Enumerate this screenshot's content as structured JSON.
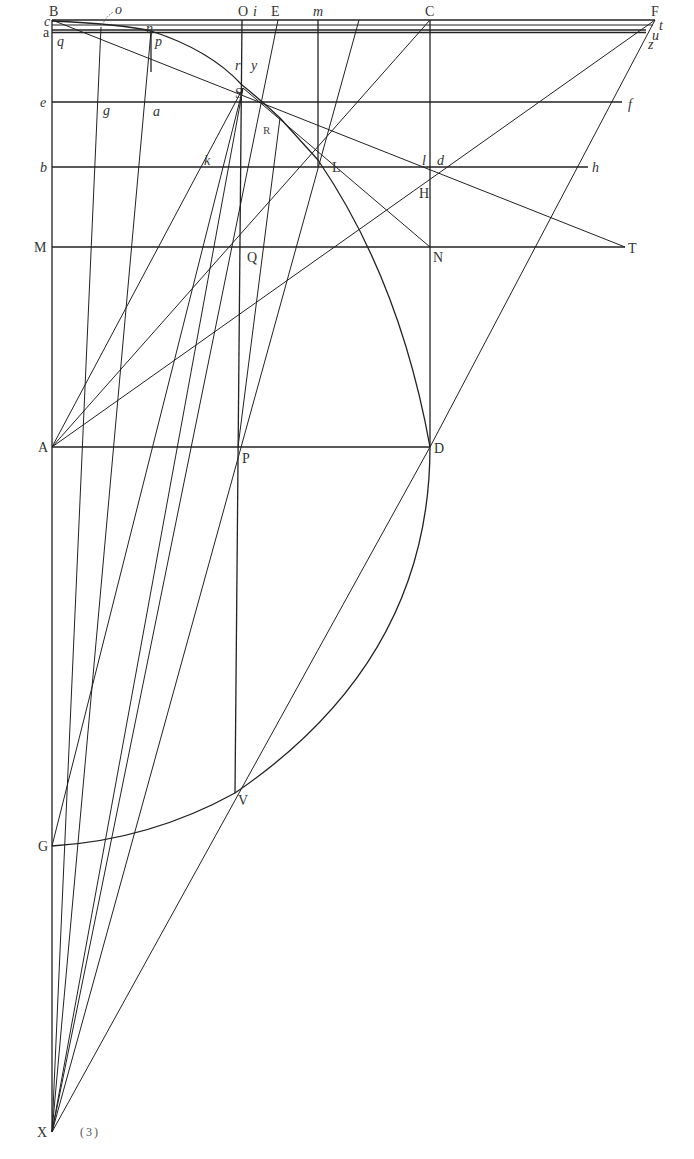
{
  "figure": {
    "caption": "(3)",
    "labels": {
      "B": "B",
      "c": "c",
      "a_left": "a",
      "q": "q",
      "e": "e",
      "b": "b",
      "M": "M",
      "A": "A",
      "G": "G",
      "X": "X",
      "o": "o",
      "eta": "η",
      "p": "p",
      "g": "g",
      "a_mid": "a",
      "O": "O",
      "i": "i",
      "E": "E",
      "m": "m",
      "C": "C",
      "F": "F",
      "r": "r",
      "y": "y",
      "S": "S",
      "R": "R",
      "k": "k",
      "L": "L",
      "l": "l",
      "d": "d",
      "H": "H",
      "h": "h",
      "Q": "Q",
      "N": "N",
      "T": "T",
      "P": "P",
      "D": "D",
      "V": "V",
      "t": "t",
      "u": "u",
      "z": "z",
      "f": "f"
    }
  }
}
